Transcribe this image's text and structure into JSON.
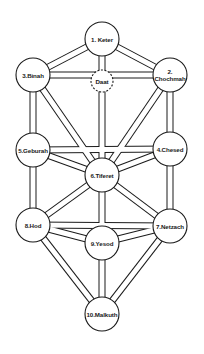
{
  "diagram": {
    "style": {
      "line_color": "#1a1a1a",
      "fill_color": "#ffffff",
      "background": "#ffffff",
      "path_width": 6,
      "path_outline": 1
    },
    "nodes": [
      {
        "id": "keter",
        "label": "1. Keter",
        "lines": [
          "1. Keter"
        ],
        "cx": 102,
        "cy": 39,
        "r": 17,
        "dashed": false
      },
      {
        "id": "chochmah",
        "label": "2. Chochmah",
        "lines": [
          "2.",
          "Chochmah"
        ],
        "cx": 170,
        "cy": 75,
        "r": 17,
        "dashed": false
      },
      {
        "id": "binah",
        "label": "3.Binah",
        "lines": [
          "3.Binah"
        ],
        "cx": 33,
        "cy": 75,
        "r": 17,
        "dashed": false
      },
      {
        "id": "daat",
        "label": "Daat",
        "lines": [
          "Daat"
        ],
        "cx": 102,
        "cy": 81,
        "r": 11,
        "dashed": true
      },
      {
        "id": "chesed",
        "label": "4.Chesed",
        "lines": [
          "4.Chesed"
        ],
        "cx": 170,
        "cy": 149,
        "r": 17,
        "dashed": false
      },
      {
        "id": "geburah",
        "label": "5.Geburah",
        "lines": [
          "5.Geburah"
        ],
        "cx": 33,
        "cy": 150,
        "r": 17,
        "dashed": false
      },
      {
        "id": "tiferet",
        "label": "6.Tiferet",
        "lines": [
          "6.Tiferet"
        ],
        "cx": 102,
        "cy": 175,
        "r": 17,
        "dashed": false
      },
      {
        "id": "netzach",
        "label": "7.Netzach",
        "lines": [
          "7.Netzach"
        ],
        "cx": 170,
        "cy": 226,
        "r": 17,
        "dashed": false
      },
      {
        "id": "hod",
        "label": "8.Hod",
        "lines": [
          "8.Hod"
        ],
        "cx": 33,
        "cy": 225,
        "r": 17,
        "dashed": false
      },
      {
        "id": "yesod",
        "label": "9.Yesod",
        "lines": [
          "9.Yesod"
        ],
        "cx": 102,
        "cy": 243,
        "r": 17,
        "dashed": false
      },
      {
        "id": "malkuth",
        "label": "10.Malkuth",
        "lines": [
          "10.Malkuth"
        ],
        "cx": 102,
        "cy": 314,
        "r": 17,
        "dashed": false
      }
    ],
    "paths": [
      {
        "from": "keter",
        "to": "binah"
      },
      {
        "from": "keter",
        "to": "chochmah"
      },
      {
        "from": "keter",
        "to": "tiferet"
      },
      {
        "from": "binah",
        "to": "chochmah"
      },
      {
        "from": "binah",
        "to": "geburah"
      },
      {
        "from": "binah",
        "to": "tiferet"
      },
      {
        "from": "chochmah",
        "to": "chesed"
      },
      {
        "from": "chochmah",
        "to": "tiferet"
      },
      {
        "from": "geburah",
        "to": "chesed"
      },
      {
        "from": "geburah",
        "to": "tiferet"
      },
      {
        "from": "chesed",
        "to": "tiferet"
      },
      {
        "from": "geburah",
        "to": "hod"
      },
      {
        "from": "chesed",
        "to": "netzach"
      },
      {
        "from": "tiferet",
        "to": "hod"
      },
      {
        "from": "tiferet",
        "to": "netzach"
      },
      {
        "from": "tiferet",
        "to": "yesod"
      },
      {
        "from": "hod",
        "to": "netzach"
      },
      {
        "from": "hod",
        "to": "yesod"
      },
      {
        "from": "netzach",
        "to": "yesod"
      },
      {
        "from": "hod",
        "to": "malkuth"
      },
      {
        "from": "netzach",
        "to": "malkuth"
      },
      {
        "from": "yesod",
        "to": "malkuth"
      }
    ]
  }
}
